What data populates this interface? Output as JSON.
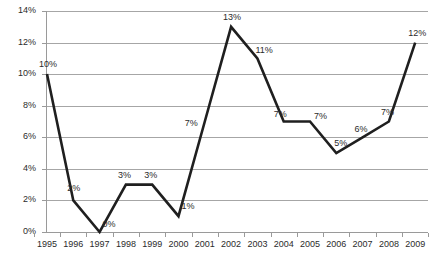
{
  "chart_data": {
    "type": "line",
    "title": "",
    "xlabel": "",
    "ylabel": "",
    "categories": [
      "1995",
      "1996",
      "1997",
      "1998",
      "1999",
      "2000",
      "2001",
      "2002",
      "2003",
      "2004",
      "2005",
      "2006",
      "2007",
      "2008",
      "2009"
    ],
    "values": [
      10,
      2,
      0,
      3,
      3,
      1,
      7,
      13,
      11,
      7,
      7,
      5,
      6,
      7,
      12
    ],
    "point_labels": [
      "10%",
      "2%",
      "0%",
      "3%",
      "3%",
      "1%",
      "7%",
      "13%",
      "11%",
      "7%",
      "7%",
      "5%",
      "6%",
      "7%",
      "12%"
    ],
    "ylim": [
      0,
      14
    ],
    "ytick_values": [
      0,
      2,
      4,
      6,
      8,
      10,
      12,
      14
    ],
    "ytick_labels": [
      "0%",
      "2%",
      "4%",
      "6%",
      "8%",
      "10%",
      "12%",
      "14%"
    ],
    "grid": true,
    "legend": "none",
    "series": [
      {
        "name": "",
        "values": [
          10,
          2,
          0,
          3,
          3,
          1,
          7,
          13,
          11,
          7,
          7,
          5,
          6,
          7,
          12
        ]
      }
    ],
    "colors": {
      "line": "#1f1f1f",
      "grid": "#a6a6a6",
      "axis": "#9a9a9a",
      "text": "#2b2b2b",
      "background": "#ffffff"
    }
  },
  "label_offsets": [
    {
      "dx": -8,
      "dy": -14
    },
    {
      "dx": -6,
      "dy": -16
    },
    {
      "dx": 3,
      "dy": -12
    },
    {
      "dx": -8,
      "dy": -14
    },
    {
      "dx": -8,
      "dy": -14
    },
    {
      "dx": 3,
      "dy": -14
    },
    {
      "dx": -20,
      "dy": -3
    },
    {
      "dx": -8,
      "dy": -14
    },
    {
      "dx": -2,
      "dy": -12
    },
    {
      "dx": -10,
      "dy": -12
    },
    {
      "dx": 4,
      "dy": -10
    },
    {
      "dx": -2,
      "dy": -14
    },
    {
      "dx": -8,
      "dy": -12
    },
    {
      "dx": -8,
      "dy": -14
    },
    {
      "dx": -7,
      "dy": -14
    }
  ]
}
